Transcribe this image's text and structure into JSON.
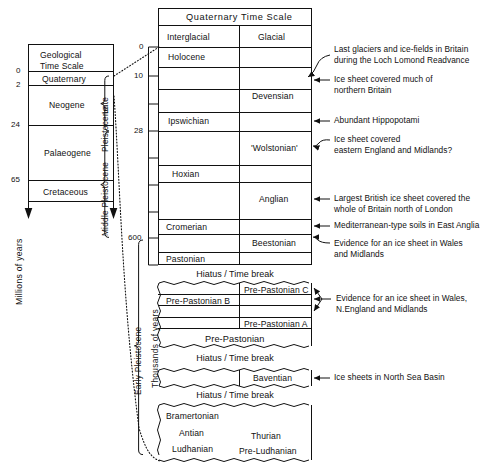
{
  "figure": {
    "title": "Quaternary Time Scale",
    "axis_left_label": "Millions of years",
    "axis_right_label": "Thousands of years"
  },
  "geological_scale": {
    "heading_line1": "Geological",
    "heading_line2": "Time Scale",
    "periods": [
      {
        "name": "Quaternary"
      },
      {
        "name": "Neogene"
      },
      {
        "name": "Palaeogene"
      },
      {
        "name": "Cretaceous"
      }
    ],
    "ticks": [
      "0",
      "2",
      "24",
      "65"
    ]
  },
  "epoch_braces": [
    {
      "label": "Late"
    },
    {
      "label": "Pleistocene"
    },
    {
      "label": "Middle Pleistocene"
    },
    {
      "label": "Early Pleistocene"
    }
  ],
  "quaternary_ticks": [
    "0",
    "10",
    "28",
    "600"
  ],
  "main_table": {
    "title": "Quaternary Time Scale",
    "columns": [
      "Interglacial",
      "Glacial"
    ],
    "rows": [
      {
        "interglacial": "Holocene",
        "glacial": ""
      },
      {
        "interglacial": "",
        "glacial": "Devensian"
      },
      {
        "interglacial": "Ipswichian",
        "glacial": ""
      },
      {
        "interglacial": "",
        "glacial": "'Wolstonian'"
      },
      {
        "interglacial": "Hoxian",
        "glacial": ""
      },
      {
        "interglacial": "",
        "glacial": "Anglian"
      },
      {
        "interglacial": "Cromerian",
        "glacial": ""
      },
      {
        "interglacial": "",
        "glacial": "Beestonian"
      },
      {
        "interglacial": "Pastonian",
        "glacial": ""
      }
    ]
  },
  "hiatus_label": "Hiatus / Time break",
  "pre_pastonian_block": {
    "rows": [
      {
        "interglacial": "",
        "glacial": "Pre-Pastonian C"
      },
      {
        "interglacial": "Pre-Pastonian B",
        "glacial": ""
      },
      {
        "interglacial": "",
        "glacial": "Pre-Pastonian A"
      }
    ],
    "full_row": "Pre-Pastonian"
  },
  "baventian_block": {
    "interglacial": "",
    "glacial": "Baventian"
  },
  "bottom_block": {
    "interglacial_lines": [
      "Bramertonian",
      "Antian",
      "Ludhanian"
    ],
    "glacial_lines": [
      "Thurian",
      "Pre-Ludhanian"
    ]
  },
  "annotations": [
    {
      "id": "loch-lomond",
      "lines": [
        "Last glaciers and ice-fields in Britain",
        "during the Loch Lomond Readvance"
      ]
    },
    {
      "id": "devensian-note",
      "lines": [
        "Ice sheet covered much of",
        "northern Britain"
      ]
    },
    {
      "id": "ipswichian-note",
      "lines": [
        "Abundant Hippopotami"
      ]
    },
    {
      "id": "wolstonian-note",
      "lines": [
        "Ice sheet covered",
        "eastern England and Midlands?"
      ]
    },
    {
      "id": "anglian-note",
      "lines": [
        "Largest British ice sheet covered the",
        "whole of Britain north of London"
      ]
    },
    {
      "id": "cromerian-note",
      "lines": [
        "Mediterranean-type soils in East Anglia"
      ]
    },
    {
      "id": "beestonian-note",
      "lines": [
        "Evidence for an ice sheet in Wales",
        "and Midlands"
      ]
    },
    {
      "id": "pre-pastonian-note",
      "lines": [
        "Evidence for an ice sheet in Wales,",
        "N.England and Midlands"
      ]
    },
    {
      "id": "baventian-note",
      "lines": [
        "Ice sheets in North Sea Basin"
      ]
    }
  ]
}
